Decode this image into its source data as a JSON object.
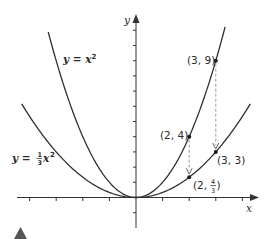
{
  "chart_data": {
    "type": "line",
    "title": "",
    "xlabel": "x",
    "ylabel": "y",
    "xlim": [
      -4,
      4
    ],
    "ylim": [
      -1,
      11
    ],
    "grid": false,
    "axis_ticks": {
      "x": [
        -4,
        -3,
        -2,
        -1,
        1,
        2,
        3,
        4
      ],
      "y": [
        -1,
        1,
        2,
        3,
        4,
        5,
        6,
        7,
        8,
        9,
        10,
        11
      ]
    },
    "series": [
      {
        "name": "y = x²",
        "function": "x^2",
        "x_range": [
          -3.3,
          3.35
        ]
      },
      {
        "name": "y = ⅓x²",
        "function": "x^2/3",
        "x_range": [
          -4.3,
          4.3
        ]
      }
    ],
    "points": [
      {
        "label": "(3, 9)",
        "x": 3,
        "y": 9
      },
      {
        "label": "(2, 4)",
        "x": 2,
        "y": 4
      },
      {
        "label": "(3, 3)",
        "x": 3,
        "y": 3
      },
      {
        "label": "(2, 4/3)",
        "x": 2,
        "y": 1.3333
      }
    ],
    "annotations": [
      {
        "type": "dashed-arrow",
        "from": [
          3,
          9
        ],
        "to": [
          3,
          3
        ]
      },
      {
        "type": "dashed-arrow",
        "from": [
          2,
          4
        ],
        "to": [
          2,
          1.3333
        ]
      }
    ]
  },
  "labels": {
    "x_axis": "x",
    "y_axis": "y",
    "curve1_lhs": "y = x",
    "curve1_exp": "2",
    "curve2_lhs": "y = ",
    "curve2_num": "1",
    "curve2_den": "3",
    "curve2_var": "x",
    "curve2_exp": "2",
    "pt_3_9": "(3, 9)",
    "pt_2_4": "(2, 4)",
    "pt_3_3": "(3, 3)",
    "pt_2_43_open": "(2, ",
    "pt_2_43_num": "4",
    "pt_2_43_den": "3",
    "pt_2_43_close": ")"
  },
  "colors": {
    "curve": "#2f2f2f",
    "axis": "#333333",
    "dash": "#9a9a9a",
    "marker": "#555555"
  }
}
